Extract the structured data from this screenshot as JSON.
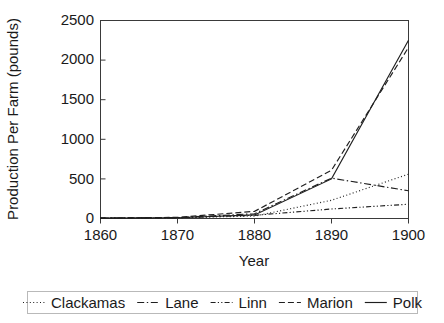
{
  "chart_data": {
    "type": "line",
    "title": "",
    "xlabel": "Year",
    "ylabel": "Production Per Farm (pounds)",
    "x": [
      1860,
      1870,
      1880,
      1890,
      1900
    ],
    "xlim": [
      1860,
      1900
    ],
    "ylim": [
      0,
      2500
    ],
    "xticks": [
      1860,
      1870,
      1880,
      1890,
      1900
    ],
    "yticks": [
      0,
      500,
      1000,
      1500,
      2000,
      2500
    ],
    "xtick_labels": [
      "1860",
      "1870",
      "1880",
      "1890",
      "1900"
    ],
    "ytick_labels": [
      "0",
      "500",
      "1000",
      "1500",
      "2000",
      "2500"
    ],
    "grid": false,
    "legend_position": "bottom",
    "series": [
      {
        "name": "Clackamas",
        "dash": "dotted",
        "values": [
          5,
          10,
          30,
          230,
          560
        ]
      },
      {
        "name": "Lane",
        "dash": "dash-dot",
        "values": [
          5,
          12,
          60,
          510,
          350
        ]
      },
      {
        "name": "Linn",
        "dash": "dash-dot-dot",
        "values": [
          5,
          10,
          40,
          120,
          180
        ]
      },
      {
        "name": "Marion",
        "dash": "dashed",
        "values": [
          5,
          15,
          90,
          610,
          2160
        ]
      },
      {
        "name": "Polk",
        "dash": "solid",
        "values": [
          5,
          10,
          45,
          500,
          2250
        ]
      }
    ]
  },
  "axes": {
    "x_title": "Year",
    "y_title": "Production Per Farm (pounds)"
  },
  "legend": {
    "items": [
      {
        "label": "Clackamas"
      },
      {
        "label": "Lane"
      },
      {
        "label": "Linn"
      },
      {
        "label": "Marion"
      },
      {
        "label": "Polk"
      }
    ]
  }
}
